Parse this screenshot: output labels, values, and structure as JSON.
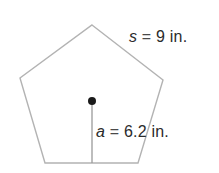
{
  "figure": {
    "name": "regular-pentagon-with-apothem",
    "shape": {
      "type": "pentagon",
      "sides": 5,
      "stroke_color": "#b3b3b3",
      "fill_color": "#ffffff",
      "vertices": [
        [
          92,
          25
        ],
        [
          163,
          80
        ],
        [
          138,
          163
        ],
        [
          45,
          163
        ],
        [
          20,
          78
        ]
      ]
    },
    "center_point": {
      "name": "center-dot",
      "x": 92,
      "y": 101,
      "radius": 4,
      "color": "#1a1a1a"
    },
    "apothem_segment": {
      "name": "apothem-line",
      "x1": 92,
      "y1": 101,
      "x2": 92,
      "y2": 163,
      "stroke_color": "#9a9a9a"
    },
    "labels": {
      "side": {
        "variable": "s",
        "operator": "=",
        "value": "9",
        "unit": "in.",
        "full_text": "s = 9 in."
      },
      "apothem": {
        "variable": "a",
        "operator": "=",
        "value": "6.2",
        "unit": "in.",
        "full_text": "a = 6.2 in."
      }
    }
  }
}
